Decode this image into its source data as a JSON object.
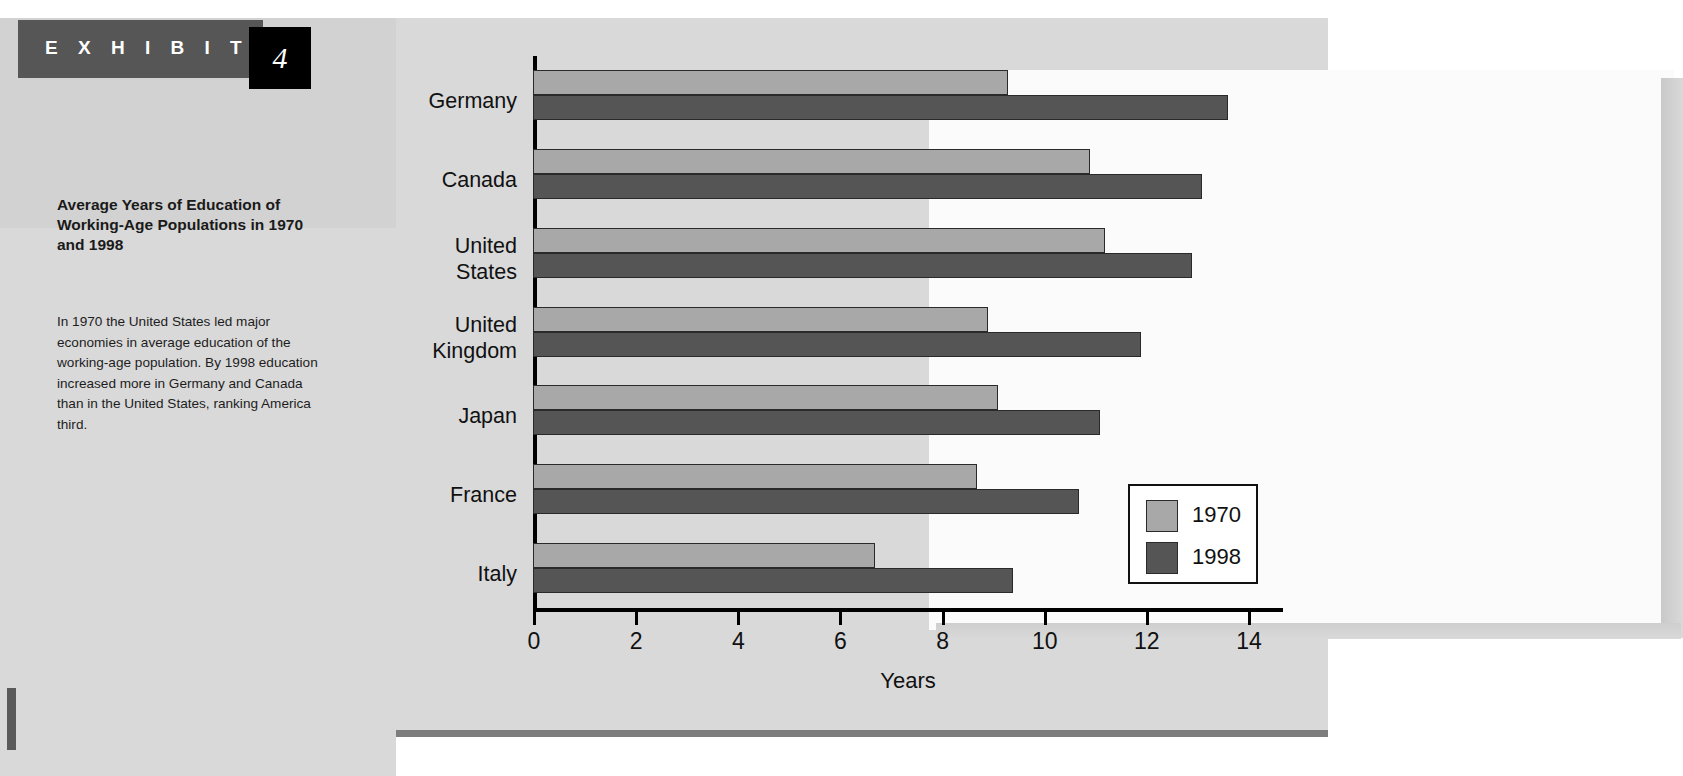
{
  "exhibit": {
    "label": "E X H I B I T",
    "number": "4",
    "title": "Average Years of Education of Working-Age Populations in 1970 and 1998",
    "description": "In 1970 the United States led major economies in average education of the working-age population. By 1998 education increased more in Germany and Canada than in the United States, ranking America third."
  },
  "colors": {
    "series_1970": "#a8a8a8",
    "series_1998": "#555555",
    "header_bar": "#565656",
    "number_box": "#000000",
    "sidebar": "#d2d2d2",
    "panel": "#d9d9d9"
  },
  "chart_data": {
    "type": "bar",
    "orientation": "horizontal",
    "title": "Average Years of Education of Working-Age Populations in 1970 and 1998",
    "xlabel": "Years",
    "ylabel": "",
    "xlim": [
      0,
      14.7
    ],
    "xticks": [
      0,
      2,
      4,
      6,
      8,
      10,
      12,
      14
    ],
    "xticklabels": [
      "0",
      "2",
      "4",
      "6",
      "8",
      "10",
      "12",
      "14"
    ],
    "grid": false,
    "legend_position": "lower-right",
    "categories": [
      "Germany",
      "Canada",
      "United States",
      "United Kingdom",
      "Japan",
      "France",
      "Italy"
    ],
    "series": [
      {
        "name": "1970",
        "color": "#a8a8a8",
        "values": [
          9.3,
          10.9,
          11.2,
          8.9,
          9.1,
          8.7,
          6.7
        ]
      },
      {
        "name": "1998",
        "color": "#555555",
        "values": [
          13.6,
          13.1,
          12.9,
          11.9,
          11.1,
          10.7,
          9.4
        ]
      }
    ]
  }
}
